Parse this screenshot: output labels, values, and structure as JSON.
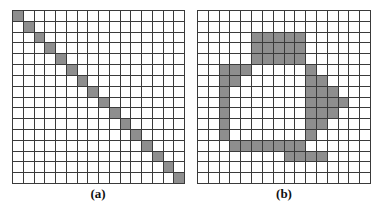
{
  "figure": {
    "panels": [
      {
        "id": "a",
        "caption": "(a)",
        "rows": 16,
        "cols": 16,
        "description": "diagonal line",
        "shaded_cells": [
          [
            0,
            0
          ],
          [
            1,
            1
          ],
          [
            2,
            2
          ],
          [
            3,
            3
          ],
          [
            4,
            4
          ],
          [
            5,
            5
          ],
          [
            6,
            6
          ],
          [
            7,
            7
          ],
          [
            8,
            8
          ],
          [
            9,
            9
          ],
          [
            10,
            10
          ],
          [
            11,
            11
          ],
          [
            12,
            12
          ],
          [
            13,
            13
          ],
          [
            14,
            14
          ],
          [
            15,
            15
          ]
        ]
      },
      {
        "id": "b",
        "caption": "(b)",
        "rows": 16,
        "cols": 16,
        "description": "closed blob outline",
        "shaded_cells": [
          [
            2,
            5
          ],
          [
            2,
            6
          ],
          [
            2,
            7
          ],
          [
            2,
            8
          ],
          [
            2,
            9
          ],
          [
            3,
            5
          ],
          [
            3,
            6
          ],
          [
            3,
            7
          ],
          [
            3,
            8
          ],
          [
            3,
            9
          ],
          [
            4,
            5
          ],
          [
            4,
            6
          ],
          [
            4,
            7
          ],
          [
            4,
            8
          ],
          [
            4,
            9
          ],
          [
            5,
            2
          ],
          [
            5,
            3
          ],
          [
            5,
            4
          ],
          [
            5,
            10
          ],
          [
            6,
            2
          ],
          [
            6,
            3
          ],
          [
            6,
            10
          ],
          [
            6,
            11
          ],
          [
            7,
            2
          ],
          [
            7,
            10
          ],
          [
            7,
            11
          ],
          [
            7,
            12
          ],
          [
            8,
            2
          ],
          [
            8,
            10
          ],
          [
            8,
            11
          ],
          [
            8,
            12
          ],
          [
            8,
            13
          ],
          [
            9,
            2
          ],
          [
            9,
            10
          ],
          [
            9,
            11
          ],
          [
            9,
            12
          ],
          [
            10,
            2
          ],
          [
            10,
            10
          ],
          [
            10,
            11
          ],
          [
            11,
            2
          ],
          [
            11,
            10
          ],
          [
            12,
            3
          ],
          [
            12,
            4
          ],
          [
            12,
            5
          ],
          [
            12,
            6
          ],
          [
            12,
            7
          ],
          [
            12,
            8
          ],
          [
            12,
            9
          ],
          [
            13,
            8
          ],
          [
            13,
            9
          ],
          [
            13,
            10
          ],
          [
            13,
            11
          ]
        ]
      }
    ],
    "colors": {
      "shaded": "#8e8e8e",
      "empty": "#ffffff",
      "grid_line": "#3a3a3a"
    }
  }
}
